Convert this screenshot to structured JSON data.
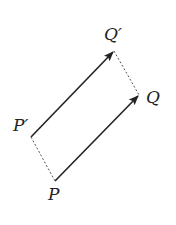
{
  "diagram": {
    "title": "",
    "labels": {
      "P": "P",
      "Q": "Q",
      "P_prime": "P′",
      "Q_prime": "Q′"
    },
    "points": {
      "P": [
        55,
        181
      ],
      "Q": [
        139,
        95
      ],
      "P_prime": [
        31,
        137
      ],
      "Q_prime": [
        114,
        51
      ]
    },
    "edges": [
      {
        "from": "P",
        "to": "Q",
        "style": "solid-arrow"
      },
      {
        "from": "P_prime",
        "to": "Q_prime",
        "style": "solid-arrow"
      },
      {
        "from": "P_prime",
        "to": "P",
        "style": "dashed"
      },
      {
        "from": "Q_prime",
        "to": "Q",
        "style": "dashed"
      }
    ],
    "colors": {
      "stroke": "#222222",
      "dashed": "#555555"
    }
  }
}
